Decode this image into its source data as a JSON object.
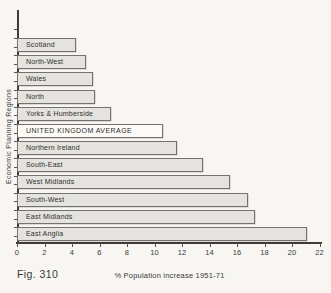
{
  "figure": {
    "caption": "Fig. 310"
  },
  "chart_data": {
    "type": "bar",
    "orientation": "horizontal",
    "title": "",
    "xlabel": "% Population increase 1951-71",
    "ylabel": "Economic Planning Regions",
    "xlim": [
      0,
      22
    ],
    "x_ticks": [
      0,
      2,
      4,
      6,
      8,
      10,
      12,
      14,
      16,
      18,
      20,
      22
    ],
    "grid": "off",
    "legend": "none",
    "categories": [
      "Scotland",
      "North-West",
      "Wales",
      "North",
      "Yorks & Humberside",
      "UNITED KINGDOM AVERAGE",
      "Northern Ireland",
      "South-East",
      "West Midlands",
      "South-West",
      "East Midlands",
      "East Anglia"
    ],
    "values": [
      4.3,
      5.0,
      5.5,
      5.7,
      6.8,
      10.6,
      11.6,
      13.5,
      15.5,
      16.8,
      17.3,
      21.1
    ],
    "highlight_category": "UNITED KINGDOM AVERAGE",
    "colors": {
      "bar_fill": "#e4e3df",
      "highlight_fill": "#fbfaf7",
      "bar_border": "#73726c",
      "axis": "#3d3c38",
      "background": "#f7f6f3"
    }
  }
}
